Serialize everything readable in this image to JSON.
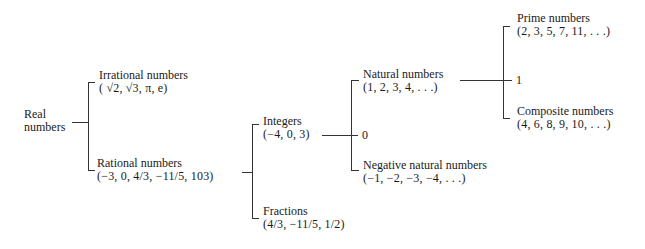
{
  "diagram": {
    "root": {
      "title_line1": "Real",
      "title_line2": "numbers"
    },
    "irrational": {
      "title": "Irrational numbers",
      "examples": "( √2,  √3, π, e)"
    },
    "rational": {
      "title": "Rational numbers",
      "examples": "(−3, 0, 4/3, −11/5, 103)"
    },
    "integers": {
      "title": "Integers",
      "examples": "(−4, 0, 3)"
    },
    "fractions": {
      "title": "Fractions",
      "examples": "(4/3, −11/5, 1/2)"
    },
    "zero": {
      "label": "0"
    },
    "natural": {
      "title": "Natural numbers",
      "examples": "(1, 2, 3, 4, . . .)"
    },
    "negative_natural": {
      "title": "Negative natural numbers",
      "examples": "(−1, −2, −3, −4, . . .)"
    },
    "one": {
      "label": "1"
    },
    "prime": {
      "title": "Prime numbers",
      "examples": "(2, 3, 5, 7, 11, . . .)"
    },
    "composite": {
      "title": "Composite numbers",
      "examples": "(4, 6, 8, 9, 10, . . .)"
    }
  }
}
